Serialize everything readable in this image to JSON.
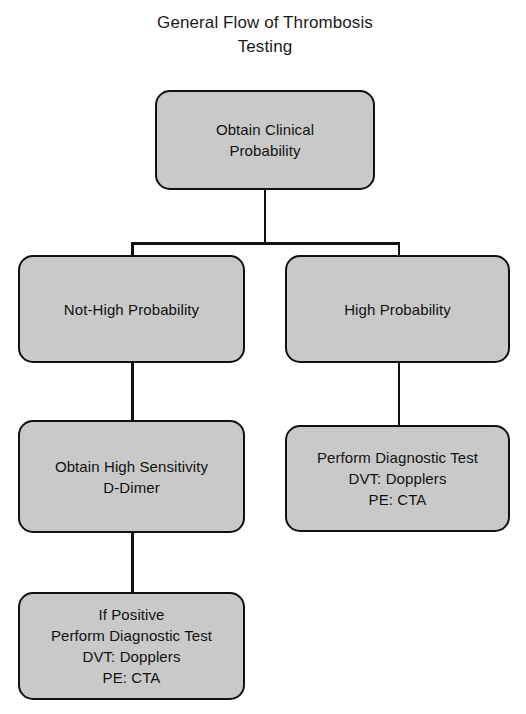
{
  "title": "General Flow of Thrombosis\nTesting",
  "colors": {
    "node_fill": "#c9c9c9",
    "node_border": "#111111",
    "connector": "#111111",
    "background": "#ffffff",
    "text": "#121212"
  },
  "nodes": {
    "clinical_probability": "Obtain Clinical\nProbability",
    "not_high_probability": "Not-High Probability",
    "high_probability": "High Probability",
    "d_dimer": "Obtain High Sensitivity\nD-Dimer",
    "high_diagnostic": "Perform Diagnostic Test\nDVT: Dopplers\nPE: CTA",
    "positive_diagnostic": "If Positive\nPerform Diagnostic Test\nDVT: Dopplers\nPE: CTA"
  },
  "chart_data": {
    "type": "diagram",
    "diagram_kind": "flowchart",
    "title": "General Flow of Thrombosis Testing",
    "orientation": "top-down",
    "nodes": [
      {
        "id": "clinical_probability",
        "label": "Obtain Clinical Probability",
        "shape": "rounded-rectangle",
        "level": 0,
        "column": "center"
      },
      {
        "id": "not_high_probability",
        "label": "Not-High Probability",
        "shape": "rounded-rectangle",
        "level": 1,
        "column": "left"
      },
      {
        "id": "high_probability",
        "label": "High Probability",
        "shape": "rounded-rectangle",
        "level": 1,
        "column": "right"
      },
      {
        "id": "d_dimer",
        "label": "Obtain High Sensitivity D-Dimer",
        "shape": "rounded-rectangle",
        "level": 2,
        "column": "left"
      },
      {
        "id": "high_diagnostic",
        "label": "Perform Diagnostic Test DVT: Dopplers PE: CTA",
        "shape": "rounded-rectangle",
        "level": 2,
        "column": "right"
      },
      {
        "id": "positive_diagnostic",
        "label": "If Positive Perform Diagnostic Test DVT: Dopplers PE: CTA",
        "shape": "rounded-rectangle",
        "level": 3,
        "column": "left"
      }
    ],
    "edges": [
      {
        "from": "clinical_probability",
        "to": "not_high_probability",
        "label": ""
      },
      {
        "from": "clinical_probability",
        "to": "high_probability",
        "label": ""
      },
      {
        "from": "not_high_probability",
        "to": "d_dimer",
        "label": ""
      },
      {
        "from": "high_probability",
        "to": "high_diagnostic",
        "label": ""
      },
      {
        "from": "d_dimer",
        "to": "positive_diagnostic",
        "label": ""
      }
    ]
  }
}
